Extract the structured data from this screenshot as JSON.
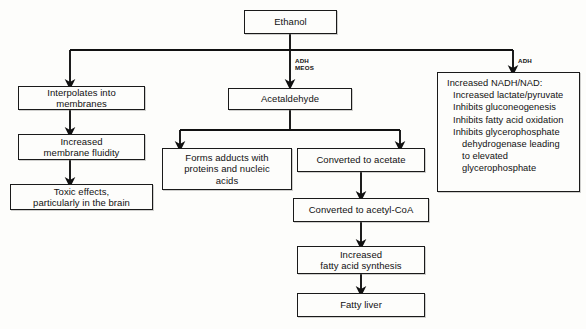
{
  "diagram": {
    "ink_color": "#111111",
    "paper_color": "#fdfdfb"
  },
  "nodes": {
    "ethanol": "Ethanol",
    "interpolates": "Interpolates into\nmembranes",
    "membrane_fluidity": "Increased\nmembrane fluidity",
    "toxic_effects": "Toxic effects,\nparticularly in the brain",
    "acetaldehyde": "Acetaldehyde",
    "adducts": "Forms adducts with\nproteins and nucleic\nacids",
    "acetate": "Converted to acetate",
    "acetyl_coa": "Converted to acetyl-CoA",
    "fatty_acid_synthesis": "Increased\nfatty acid synthesis",
    "fatty_liver": "Fatty liver",
    "nadh": {
      "heading": "Increased NADH/NAD:",
      "items": [
        "Increased lactate/pyruvate",
        "Inhibits gluconeogenesis",
        "Inhibits fatty acid oxidation",
        "Inhibits glycerophosphate"
      ],
      "continuation": [
        "dehydrogenase leading",
        "to elevated",
        "glycerophosphate"
      ]
    }
  },
  "edge_labels": {
    "middle_branch": "ADH\nMEOS",
    "right_branch": "ADH"
  }
}
